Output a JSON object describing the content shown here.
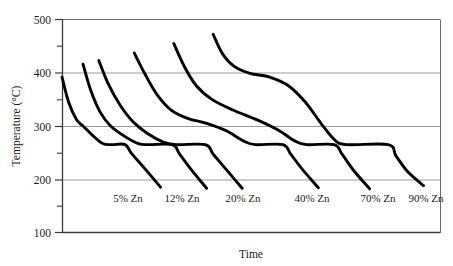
{
  "chart_data": {
    "type": "line",
    "title": "",
    "xlabel": "Time",
    "ylabel": "Temperature (°C)",
    "ylim": [
      100,
      500
    ],
    "yticks": [
      100,
      200,
      300,
      400,
      500
    ],
    "ytick_labels": [
      "100",
      "200",
      "300",
      "400",
      "500"
    ],
    "yminor_ticks": [
      150,
      250,
      350,
      450
    ],
    "xticks": [],
    "xtick_labels": [],
    "grid": "horizontal-major-only",
    "legend": "inline-annotations-at-curve-ends",
    "eutectic_temperature": 265,
    "annotations": [
      {
        "text": "5% Zn",
        "near_curve": "5% Zn"
      },
      {
        "text": "12% Zn",
        "near_curve": "12% Zn"
      },
      {
        "text": "20% Zn",
        "near_curve": "20% Zn"
      },
      {
        "text": "40% Zn",
        "near_curve": "40% Zn"
      },
      {
        "text": "70% Zn",
        "near_curve": "70% Zn"
      },
      {
        "text": "90% Zn",
        "near_curve": "90% Zn"
      }
    ],
    "series": [
      {
        "name": "5% Zn",
        "label": "5% Zn",
        "liquidus_temp": 390,
        "eutectic_temp": 265,
        "end_temp": 185,
        "points": [
          {
            "t": 0.0,
            "T": 392
          },
          {
            "t": 1.0,
            "T": 345
          },
          {
            "t": 2.2,
            "T": 312
          },
          {
            "t": 3.2,
            "T": 300
          },
          {
            "t": 4.6,
            "T": 283
          },
          {
            "t": 6.2,
            "T": 267
          },
          {
            "t": 7.6,
            "T": 265
          },
          {
            "t": 9.6,
            "T": 265
          },
          {
            "t": 10.6,
            "T": 248
          },
          {
            "t": 12.6,
            "T": 220
          },
          {
            "t": 15.0,
            "T": 185
          }
        ]
      },
      {
        "name": "12% Zn",
        "label": "12% Zn",
        "liquidus_temp": 416,
        "eutectic_temp": 265,
        "end_temp": 183,
        "points": [
          {
            "t": 3.2,
            "T": 416
          },
          {
            "t": 4.4,
            "T": 366
          },
          {
            "t": 5.8,
            "T": 326
          },
          {
            "t": 7.4,
            "T": 300
          },
          {
            "t": 9.6,
            "T": 280
          },
          {
            "t": 11.6,
            "T": 267
          },
          {
            "t": 13.2,
            "T": 265
          },
          {
            "t": 16.8,
            "T": 265
          },
          {
            "t": 17.9,
            "T": 247
          },
          {
            "t": 19.6,
            "T": 219
          },
          {
            "t": 22.0,
            "T": 183
          }
        ]
      },
      {
        "name": "20% Zn",
        "label": "20% Zn",
        "liquidus_temp": 423,
        "eutectic_temp": 265,
        "end_temp": 183,
        "points": [
          {
            "t": 5.6,
            "T": 423
          },
          {
            "t": 7.0,
            "T": 380
          },
          {
            "t": 8.8,
            "T": 340
          },
          {
            "t": 10.8,
            "T": 308
          },
          {
            "t": 13.0,
            "T": 286
          },
          {
            "t": 15.4,
            "T": 270
          },
          {
            "t": 17.4,
            "T": 265
          },
          {
            "t": 21.8,
            "T": 265
          },
          {
            "t": 23.0,
            "T": 247
          },
          {
            "t": 25.0,
            "T": 218
          },
          {
            "t": 27.4,
            "T": 183
          }
        ]
      },
      {
        "name": "40% Zn",
        "label": "40% Zn",
        "liquidus_temp": 437,
        "eutectic_temp": 265,
        "end_temp": 184,
        "points": [
          {
            "t": 11.0,
            "T": 437
          },
          {
            "t": 12.6,
            "T": 398
          },
          {
            "t": 14.4,
            "T": 360
          },
          {
            "t": 16.6,
            "T": 330
          },
          {
            "t": 19.2,
            "T": 314
          },
          {
            "t": 22.0,
            "T": 305
          },
          {
            "t": 25.0,
            "T": 291
          },
          {
            "t": 27.6,
            "T": 272
          },
          {
            "t": 29.4,
            "T": 265
          },
          {
            "t": 33.6,
            "T": 265
          },
          {
            "t": 34.8,
            "T": 247
          },
          {
            "t": 36.6,
            "T": 218
          },
          {
            "t": 39.0,
            "T": 184
          }
        ]
      },
      {
        "name": "70% Zn",
        "label": "70% Zn",
        "liquidus_temp": 455,
        "eutectic_temp": 265,
        "end_temp": 182,
        "points": [
          {
            "t": 17.0,
            "T": 455
          },
          {
            "t": 18.6,
            "T": 412
          },
          {
            "t": 20.4,
            "T": 376
          },
          {
            "t": 22.8,
            "T": 350
          },
          {
            "t": 26.0,
            "T": 330
          },
          {
            "t": 29.6,
            "T": 312
          },
          {
            "t": 32.8,
            "T": 293
          },
          {
            "t": 35.4,
            "T": 272
          },
          {
            "t": 37.2,
            "T": 265
          },
          {
            "t": 41.4,
            "T": 265
          },
          {
            "t": 42.6,
            "T": 247
          },
          {
            "t": 44.4,
            "T": 216
          },
          {
            "t": 46.8,
            "T": 182
          }
        ]
      },
      {
        "name": "90% Zn",
        "label": "90% Zn",
        "liquidus_temp": 472,
        "eutectic_temp": 265,
        "end_temp": 188,
        "points": [
          {
            "t": 23.0,
            "T": 472
          },
          {
            "t": 24.4,
            "T": 436
          },
          {
            "t": 26.2,
            "T": 412
          },
          {
            "t": 28.6,
            "T": 399
          },
          {
            "t": 31.6,
            "T": 392
          },
          {
            "t": 34.4,
            "T": 376
          },
          {
            "t": 37.0,
            "T": 345
          },
          {
            "t": 39.4,
            "T": 305
          },
          {
            "t": 41.4,
            "T": 275
          },
          {
            "t": 43.2,
            "T": 265
          },
          {
            "t": 49.6,
            "T": 265
          },
          {
            "t": 50.8,
            "T": 244
          },
          {
            "t": 52.6,
            "T": 214
          },
          {
            "t": 55.0,
            "T": 188
          }
        ]
      }
    ],
    "colors": {
      "curve": "#000000",
      "grid": "#9a9a9a",
      "axis": "#555555",
      "text": "#1a1a1a",
      "background": "#ffffff"
    }
  }
}
